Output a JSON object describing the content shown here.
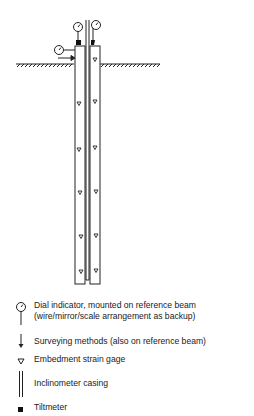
{
  "diagram": {
    "ground_line_y": 64
  },
  "legend": [
    {
      "icon": "dial-indicator-icon",
      "lines": [
        "Dial indicator, mounted on reference beam",
        "(wire/mirror/scale arrangement as backup)"
      ]
    },
    {
      "icon": "surveying-arrow-icon",
      "lines": [
        "Surveying methods (also on reference beam)"
      ]
    },
    {
      "icon": "strain-gage-triangle-icon",
      "lines": [
        "Embedment strain gage"
      ]
    },
    {
      "icon": "inclinometer-casing-icon",
      "lines": [
        "Inclinometer casing"
      ]
    },
    {
      "icon": "tiltmeter-square-icon",
      "lines": [
        "Tiltmeter"
      ]
    }
  ]
}
